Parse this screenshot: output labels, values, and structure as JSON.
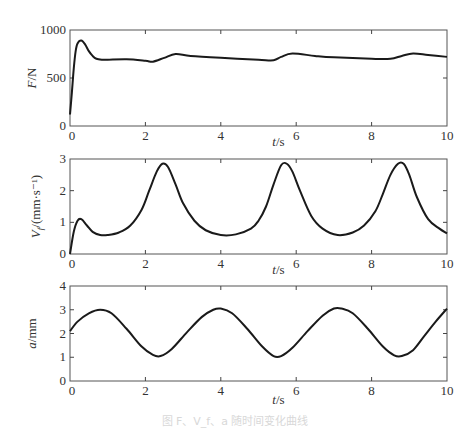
{
  "figure": {
    "caption": "图  F、V_f、a 随时间变化曲线"
  },
  "chart_data": [
    {
      "type": "line",
      "id": "force",
      "title": "",
      "xlabel": "t/s",
      "ylabel": "F/N",
      "xlim": [
        0,
        10
      ],
      "ylim": [
        0,
        1000
      ],
      "xticks": [
        0,
        2,
        4,
        6,
        8,
        10
      ],
      "yticks": [
        0,
        500,
        1000
      ],
      "xtick_labels": [
        "0",
        "2",
        "4",
        "6",
        "8",
        "10"
      ],
      "ytick_labels": [
        "0",
        "500",
        "1000"
      ],
      "grid": false,
      "legend": "none",
      "series": [
        {
          "name": "F",
          "x": [
            0,
            0.05,
            0.1,
            0.15,
            0.2,
            0.3,
            0.4,
            0.5,
            0.6,
            0.7,
            0.85,
            1.0,
            1.5,
            2.0,
            2.2,
            2.5,
            2.8,
            3.2,
            4.0,
            5.0,
            5.4,
            5.6,
            5.9,
            6.5,
            7.0,
            8.0,
            8.5,
            8.8,
            9.1,
            9.5,
            10.0
          ],
          "y": [
            120,
            350,
            600,
            780,
            860,
            890,
            850,
            780,
            730,
            700,
            690,
            690,
            695,
            680,
            670,
            710,
            750,
            730,
            710,
            690,
            685,
            720,
            755,
            730,
            715,
            700,
            700,
            730,
            755,
            740,
            720
          ]
        }
      ]
    },
    {
      "type": "line",
      "id": "velocity",
      "title": "",
      "xlabel": "t/s",
      "ylabel": "V_f/(mm·s⁻¹)",
      "xlim": [
        0,
        10
      ],
      "ylim": [
        0,
        3
      ],
      "xticks": [
        0,
        2,
        4,
        6,
        8,
        10
      ],
      "yticks": [
        0,
        1,
        2,
        3
      ],
      "xtick_labels": [
        "0",
        "2",
        "4",
        "6",
        "8",
        "10"
      ],
      "ytick_labels": [
        "0",
        "1",
        "2",
        "3"
      ],
      "grid": false,
      "legend": "none",
      "series": [
        {
          "name": "V_f",
          "x": [
            0,
            0.1,
            0.2,
            0.3,
            0.45,
            0.6,
            0.8,
            1.0,
            1.3,
            1.6,
            1.9,
            2.1,
            2.3,
            2.45,
            2.6,
            2.8,
            3.0,
            3.3,
            3.6,
            4.0,
            4.4,
            4.8,
            5.0,
            5.2,
            5.4,
            5.6,
            5.75,
            5.9,
            6.1,
            6.4,
            6.7,
            7.1,
            7.5,
            7.8,
            8.1,
            8.3,
            8.5,
            8.7,
            8.85,
            9.0,
            9.2,
            9.5,
            9.8,
            10.0
          ],
          "y": [
            0,
            0.7,
            1.05,
            1.1,
            0.9,
            0.7,
            0.6,
            0.6,
            0.68,
            0.9,
            1.4,
            2.0,
            2.6,
            2.85,
            2.75,
            2.2,
            1.6,
            1.05,
            0.75,
            0.6,
            0.62,
            0.8,
            1.05,
            1.5,
            2.2,
            2.8,
            2.85,
            2.6,
            2.0,
            1.2,
            0.8,
            0.6,
            0.68,
            0.9,
            1.35,
            1.9,
            2.5,
            2.85,
            2.85,
            2.5,
            1.8,
            1.1,
            0.8,
            0.65
          ]
        }
      ]
    },
    {
      "type": "line",
      "id": "displacement",
      "title": "",
      "xlabel": "t/s",
      "ylabel": "a/mm",
      "xlim": [
        0,
        10
      ],
      "ylim": [
        0,
        4
      ],
      "xticks": [
        0,
        2,
        4,
        6,
        8,
        10
      ],
      "yticks": [
        0,
        1,
        2,
        3,
        4
      ],
      "xtick_labels": [
        "0",
        "2",
        "4",
        "6",
        "8",
        "10"
      ],
      "ytick_labels": [
        "0",
        "1",
        "2",
        "3",
        "4"
      ],
      "grid": false,
      "legend": "none",
      "series": [
        {
          "name": "a",
          "x": [
            0,
            0.2,
            0.5,
            0.8,
            1.1,
            1.5,
            1.9,
            2.2,
            2.4,
            2.7,
            3.1,
            3.5,
            3.8,
            4.0,
            4.3,
            4.7,
            5.1,
            5.4,
            5.6,
            5.9,
            6.3,
            6.7,
            7.0,
            7.2,
            7.5,
            7.9,
            8.3,
            8.6,
            8.8,
            9.1,
            9.4,
            9.7,
            10.0
          ],
          "y": [
            2.1,
            2.5,
            2.85,
            3.0,
            2.85,
            2.2,
            1.45,
            1.1,
            1.05,
            1.35,
            2.05,
            2.7,
            3.0,
            3.05,
            2.85,
            2.2,
            1.45,
            1.05,
            1.05,
            1.4,
            2.1,
            2.75,
            3.05,
            3.05,
            2.85,
            2.2,
            1.45,
            1.08,
            1.05,
            1.3,
            1.9,
            2.5,
            3.05
          ]
        }
      ]
    }
  ]
}
